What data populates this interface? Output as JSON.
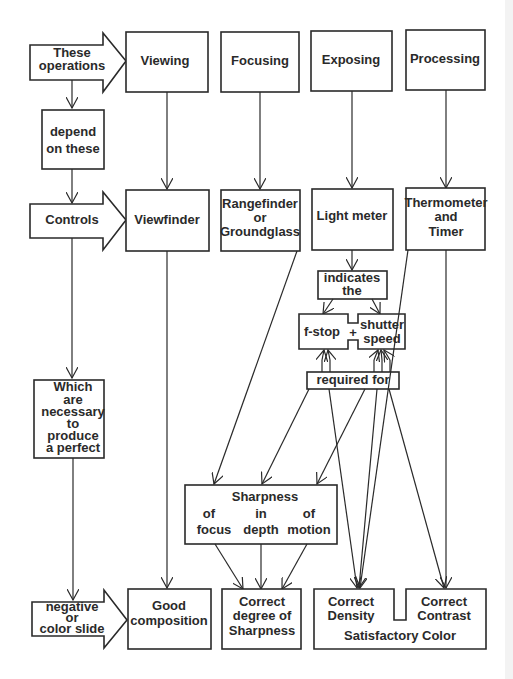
{
  "diagram": {
    "left_column": {
      "these_operations": [
        "These",
        "operations"
      ],
      "depend_on_these": [
        "depend",
        "on these"
      ],
      "controls": "Controls",
      "which_necessary": [
        "Which",
        "are",
        "necessary",
        "to",
        "produce",
        "a perfect"
      ],
      "negative_or_slide": [
        "negative",
        "or",
        "color slide"
      ]
    },
    "operations": {
      "viewing": "Viewing",
      "focusing": "Focusing",
      "exposing": "Exposing",
      "processing": "Processing"
    },
    "controls": {
      "viewfinder": "Viewfinder",
      "rangefinder": [
        "Rangefinder",
        "or",
        "Groundglass"
      ],
      "light_meter": "Light meter",
      "thermometer": [
        "Thermometer",
        "and",
        "Timer"
      ]
    },
    "exposure_chain": {
      "indicates": [
        "indicates",
        "the"
      ],
      "fstop": "f-stop",
      "plus": "+",
      "shutter": [
        "shutter",
        "speed"
      ],
      "required_for": "required for"
    },
    "sharpness": {
      "title": "Sharpness",
      "of1": "of",
      "focus": "focus",
      "in": "in",
      "depth": "depth",
      "of2": "of",
      "motion": "motion"
    },
    "results": {
      "good_composition": [
        "Good",
        "composition"
      ],
      "correct_sharpness": [
        "Correct",
        "degree of",
        "Sharpness"
      ],
      "correct_density": [
        "Correct",
        "Density"
      ],
      "correct_contrast": [
        "Correct",
        "Contrast"
      ],
      "satisfactory_color": "Satisfactory Color"
    }
  }
}
